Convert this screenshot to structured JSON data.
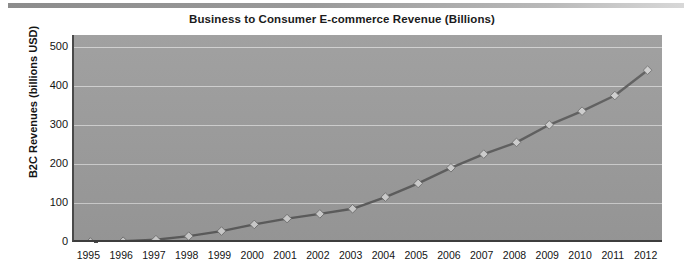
{
  "chart_data": {
    "type": "line",
    "title": "Business to Consumer E-commerce Revenue (Billions)",
    "xlabel": "",
    "ylabel": "B2C Revenues (billions USD)",
    "categories": [
      "1995",
      "1996",
      "1997",
      "1998",
      "1999",
      "2000",
      "2001",
      "2002",
      "2003",
      "2004",
      "2005",
      "2006",
      "2007",
      "2008",
      "2009",
      "2010",
      "2011",
      "2012"
    ],
    "values": [
      0,
      2,
      6,
      15,
      28,
      45,
      60,
      72,
      85,
      115,
      150,
      190,
      225,
      255,
      300,
      335,
      375,
      440
    ],
    "series": [
      {
        "name": "B2C Revenues",
        "values": [
          0,
          2,
          6,
          15,
          28,
          45,
          60,
          72,
          85,
          115,
          150,
          190,
          225,
          255,
          300,
          335,
          375,
          440
        ]
      }
    ],
    "yticks": [
      0,
      100,
      200,
      300,
      400,
      500
    ],
    "ylim": [
      0,
      530
    ],
    "grid": true,
    "legend": "none",
    "marker": "diamond",
    "colors": {
      "plot_background": "#9b9b9b",
      "gridline": "#d7d7d7",
      "line": "#5d5d5d",
      "marker_fill": "#cfcfcf",
      "axis": "#3d3d3d",
      "text": "#141414",
      "page_background": "#ffffff",
      "top_bar": "#8c8c8c"
    }
  },
  "header": {
    "top_bar_label": "decorative-bar"
  }
}
